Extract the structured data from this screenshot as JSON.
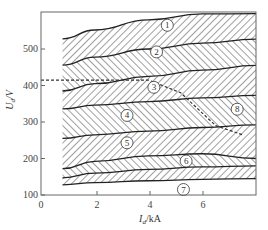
{
  "chart_data": {
    "type": "area",
    "title": "",
    "xlabel": "I_d/kA",
    "ylabel": "U_d/V",
    "xlim": [
      0,
      8
    ],
    "ylim": [
      100,
      600
    ],
    "x_ticks": [
      0,
      2,
      4,
      6
    ],
    "y_ticks": [
      100,
      200,
      300,
      400,
      500
    ],
    "grid": false,
    "x": [
      0.8,
      2,
      4,
      6,
      8
    ],
    "boundaries": [
      {
        "name": "top",
        "values": [
          528,
          552,
          580,
          596,
          597
        ]
      },
      {
        "name": "1-2",
        "values": [
          456,
          478,
          500,
          516,
          527
        ]
      },
      {
        "name": "2-3",
        "values": [
          385,
          405,
          425,
          442,
          455
        ]
      },
      {
        "name": "3-4",
        "values": [
          336,
          346,
          356,
          366,
          373
        ]
      },
      {
        "name": "4-5",
        "values": [
          255,
          265,
          275,
          285,
          292
        ]
      },
      {
        "name": "5-6",
        "values": [
          172,
          192,
          207,
          213,
          200
        ]
      },
      {
        "name": "6-7",
        "values": [
          147,
          160,
          170,
          177,
          180
        ]
      },
      {
        "name": "bottom",
        "values": [
          128,
          134,
          139,
          143,
          145
        ]
      }
    ],
    "regions": [
      {
        "label": "1",
        "between": [
          "top",
          "1-2"
        ],
        "label_pos": [
          4.7,
          565
        ]
      },
      {
        "label": "2",
        "between": [
          "1-2",
          "2-3"
        ],
        "label_pos": [
          4.3,
          492
        ]
      },
      {
        "label": "3",
        "between": [
          "2-3",
          "3-4"
        ],
        "label_pos": [
          4.2,
          395
        ]
      },
      {
        "label": "4",
        "between": [
          "3-4",
          "4-5"
        ],
        "label_pos": [
          3.2,
          318
        ]
      },
      {
        "label": "5",
        "between": [
          "4-5",
          "5-6"
        ],
        "label_pos": [
          3.2,
          243
        ]
      },
      {
        "label": "6",
        "between": [
          "5-6",
          "6-7"
        ],
        "label_pos": [
          5.4,
          193
        ]
      },
      {
        "label": "7",
        "between": [
          "6-7",
          "bottom"
        ],
        "label_pos": [
          5.3,
          115
        ]
      }
    ],
    "annotation_line_8": {
      "label": "8",
      "description": "dashed hatched limit line",
      "points": [
        [
          0,
          415
        ],
        [
          4,
          415
        ],
        [
          5.2,
          380
        ],
        [
          6.5,
          290
        ],
        [
          7.5,
          265
        ]
      ],
      "label_pos": [
        7.3,
        335
      ]
    },
    "legend_position": "none"
  },
  "axes": {
    "xlabel_main": "I",
    "xlabel_sub": "d",
    "xlabel_unit": "/kA",
    "ylabel_main": "U",
    "ylabel_sub": "d",
    "ylabel_unit": "/V"
  }
}
